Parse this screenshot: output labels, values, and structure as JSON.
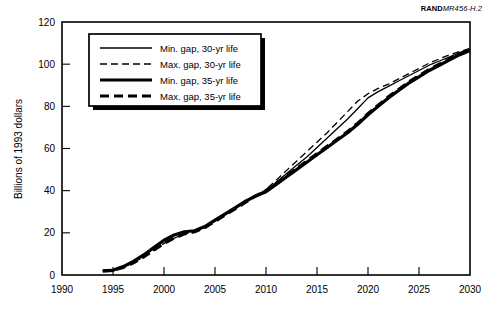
{
  "credit": {
    "brand": "RAND",
    "docnum": "MR456-H.2"
  },
  "chart_data": {
    "type": "line",
    "title": "",
    "xlabel": "",
    "ylabel": "Billions of 1993 dollars",
    "xlim": [
      1990,
      2030
    ],
    "ylim": [
      0,
      120
    ],
    "xticks": [
      1990,
      1995,
      2000,
      2005,
      2010,
      2015,
      2020,
      2025,
      2030
    ],
    "yticks": [
      0,
      20,
      40,
      60,
      80,
      100,
      120
    ],
    "grid": false,
    "legend_position": "upper-left",
    "x": [
      1994,
      1995,
      1996,
      1997,
      1998,
      1999,
      2000,
      2001,
      2002,
      2003,
      2004,
      2005,
      2006,
      2007,
      2008,
      2009,
      2010,
      2011,
      2012,
      2013,
      2014,
      2015,
      2016,
      2017,
      2018,
      2019,
      2020,
      2021,
      2022,
      2023,
      2024,
      2025,
      2026,
      2027,
      2028,
      2029,
      2030
    ],
    "series": [
      {
        "name": "Min. gap, 30-yr life",
        "style": "solid",
        "width": 1.3,
        "values": [
          2,
          2.2,
          4,
          6.5,
          9.5,
          13,
          16.5,
          19,
          20.5,
          21,
          23,
          26,
          29,
          32,
          35,
          37.5,
          40,
          44,
          48,
          52,
          56,
          60.5,
          65,
          69.5,
          74,
          79,
          84,
          87,
          89.5,
          92,
          94.5,
          97,
          99.5,
          101.5,
          103.5,
          105.5,
          107
        ]
      },
      {
        "name": "Max. gap, 30-yr life",
        "style": "dashed",
        "width": 1.3,
        "values": [
          2,
          2.2,
          3.6,
          5.8,
          8.6,
          11.8,
          15,
          17.5,
          19.5,
          20.5,
          22.5,
          25.5,
          28.5,
          31.5,
          34.5,
          37.5,
          40.5,
          45,
          49.5,
          54,
          58.5,
          63,
          67.5,
          72.5,
          77.5,
          82.5,
          86,
          88.5,
          90.5,
          93,
          95.5,
          98,
          100.5,
          102.5,
          104.5,
          106,
          107.5
        ]
      },
      {
        "name": "Min. gap, 35-yr life",
        "style": "solid",
        "width": 3.2,
        "values": [
          2,
          2.2,
          4,
          6.5,
          9.5,
          13,
          16.5,
          19,
          20.5,
          21,
          23,
          26,
          29,
          32,
          35,
          37.5,
          39.5,
          43,
          46.5,
          50,
          53.5,
          57,
          60.5,
          64,
          67.5,
          71.5,
          76,
          80,
          84,
          87.5,
          91,
          94,
          97,
          99.5,
          102,
          104.5,
          106.5
        ]
      },
      {
        "name": "Max. gap, 35-yr life",
        "style": "dashed",
        "width": 3.2,
        "values": [
          2,
          2.2,
          3.6,
          5.8,
          8.6,
          11.8,
          15,
          17.5,
          19.5,
          20.5,
          22.5,
          25.5,
          28.5,
          31.5,
          34.5,
          37.5,
          40,
          43.5,
          47,
          50.5,
          54,
          57.5,
          61,
          64.5,
          68,
          72,
          76.5,
          80.5,
          84.5,
          88,
          91.5,
          94.5,
          97.5,
          100,
          102.5,
          105,
          107
        ]
      }
    ]
  }
}
